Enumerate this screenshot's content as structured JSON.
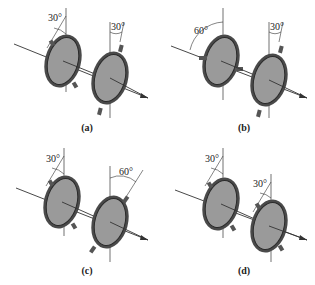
{
  "figure": {
    "colors": {
      "disc_fill": "#9a9a9a",
      "rim": "#3a3a3a",
      "line": "#333333"
    },
    "panels": [
      {
        "id": "a",
        "caption": "(a)",
        "polarizer1_angle": "30°",
        "polarizer2_angle": "30°",
        "polarizer2_tilt": "right"
      },
      {
        "id": "b",
        "caption": "(b)",
        "polarizer1_angle": "60°",
        "polarizer2_angle": "30°",
        "polarizer2_tilt": "right"
      },
      {
        "id": "c",
        "caption": "(c)",
        "polarizer1_angle": "30°",
        "polarizer2_angle": "60°",
        "polarizer2_tilt": "right"
      },
      {
        "id": "d",
        "caption": "(d)",
        "polarizer1_angle": "30°",
        "polarizer2_angle": "30°",
        "polarizer2_tilt": "left"
      }
    ]
  }
}
